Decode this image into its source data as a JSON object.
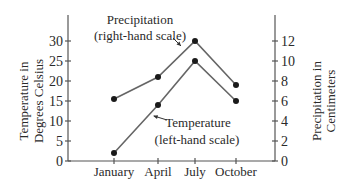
{
  "chart_data": {
    "type": "line",
    "title": "",
    "categories": [
      "January",
      "April",
      "July",
      "October"
    ],
    "xlabel": "",
    "y_left": {
      "label_lines": [
        "Temperature in",
        "Degrees Celsius"
      ],
      "range": [
        0,
        30
      ],
      "ticks": [
        0,
        5,
        10,
        15,
        20,
        25,
        30
      ]
    },
    "y_right": {
      "label_lines": [
        "Precipitation in",
        "Centimeters"
      ],
      "range": [
        0,
        12
      ],
      "ticks": [
        0,
        2,
        4,
        6,
        8,
        10,
        12
      ]
    },
    "series": [
      {
        "name": "Precipitation",
        "axis": "right",
        "annotation_lines": [
          "Precipitation",
          "(right-hand scale)"
        ],
        "values": [
          6.2,
          8.4,
          12,
          7.6
        ]
      },
      {
        "name": "Temperature",
        "axis": "left",
        "annotation_lines": [
          "Temperature",
          "(left-hand scale)"
        ],
        "values": [
          2,
          14,
          25,
          15
        ]
      }
    ],
    "grid": false,
    "legend": "inline annotations with arrows"
  },
  "layout": {
    "plot_left_x": 68,
    "plot_right_x": 275,
    "baseline_y": 161,
    "top_y": 41,
    "axis_top_y": 15,
    "category_x": [
      114,
      158,
      195,
      236
    ],
    "colors": {
      "line": "#666666",
      "dot": "#1a1a1a",
      "axis": "#555555",
      "text": "#2a2a2a"
    }
  }
}
